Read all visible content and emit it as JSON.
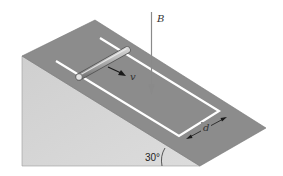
{
  "figure": {
    "labels": {
      "field": "B",
      "velocity": "v",
      "rail_spacing": "d",
      "angle": "30°"
    },
    "colors": {
      "incline_top": "#8c8c8c",
      "incline_side": "#d6d6d6",
      "rails": "#ffffff",
      "rod": "#b5b5b5",
      "arrow_dark": "#1a1a1a",
      "field_arrow": "#8a8a8a",
      "background": "#ffffff"
    }
  }
}
